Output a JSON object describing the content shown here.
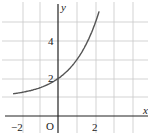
{
  "chart_data": {
    "type": "line",
    "title": "",
    "xlabel": "x",
    "ylabel": "y",
    "origin_label": "O",
    "function": "y = 2^x + 1",
    "x_tick_labels": [
      "−2",
      "2"
    ],
    "y_tick_labels": [
      "2",
      "4"
    ],
    "xlim": [
      -3,
      4.8
    ],
    "ylim": [
      -0.9,
      6.2
    ],
    "grid": true,
    "series": [
      {
        "name": "curve",
        "x": [
          -2.4,
          -2,
          -1.5,
          -1,
          -0.5,
          0,
          0.5,
          1,
          1.5,
          2,
          2.2
        ],
        "y": [
          1.19,
          1.25,
          1.35,
          1.5,
          1.71,
          2,
          2.41,
          3,
          3.83,
          5,
          5.59
        ]
      }
    ]
  },
  "labels": {
    "x_axis": "x",
    "y_axis": "y",
    "origin": "O",
    "x_neg2": "−2",
    "x_2": "2",
    "y_2": "2",
    "y_4": "4"
  }
}
